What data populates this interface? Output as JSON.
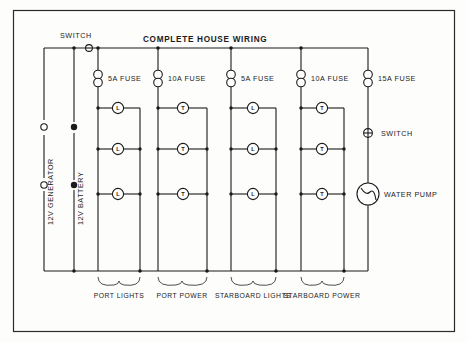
{
  "diagram": {
    "title": "COMPLETE  HOUSE   WIRING",
    "sources": {
      "generator_label": "12V GENERATOR",
      "battery_label": "12V BATTERY"
    },
    "main_switch_label": "SWITCH",
    "pump_switch_label": "SWITCH",
    "pump_label": "WATER PUMP",
    "fuses": [
      {
        "label": "5A FUSE",
        "rating": "5A"
      },
      {
        "label": "10A FUSE",
        "rating": "10A"
      },
      {
        "label": "5A FUSE",
        "rating": "5A"
      },
      {
        "label": "10A FUSE",
        "rating": "10A"
      },
      {
        "label": "15A FUSE",
        "rating": "15A"
      }
    ],
    "circuits": [
      {
        "name": "PORT LIGHTS",
        "device_glyph": "L",
        "device_count": 3,
        "fuse": "5A FUSE"
      },
      {
        "name": "PORT POWER",
        "device_glyph": "T",
        "device_count": 3,
        "fuse": "10A FUSE"
      },
      {
        "name": "STARBOARD LIGHTS",
        "device_glyph": "L",
        "device_count": 3,
        "fuse": "5A FUSE"
      },
      {
        "name": "STARBOARD POWER",
        "device_glyph": "T",
        "device_count": 3,
        "fuse": "10A FUSE"
      }
    ],
    "colors": {
      "ink": "#1a1a1a",
      "paper": "#fdfdfc",
      "frame": "#2a2a2a"
    }
  }
}
